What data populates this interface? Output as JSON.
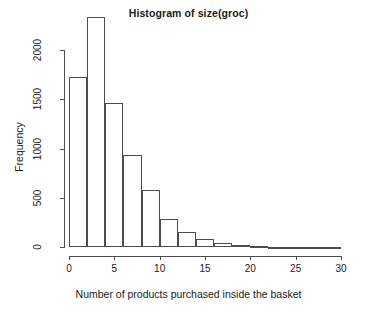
{
  "chart_data": {
    "type": "bar",
    "title": "Histogram of size(groc)",
    "xlabel": "Number of products purchased inside the basket",
    "ylabel": "Frequency",
    "grid": false,
    "legend": null,
    "xlim": [
      0,
      30
    ],
    "ylim": [
      0,
      2340
    ],
    "bin_width": 2,
    "xticks": [
      0,
      5,
      10,
      15,
      20,
      25,
      30
    ],
    "xtick_labels": [
      "0",
      "5",
      "10",
      "15",
      "20",
      "25",
      "30"
    ],
    "yticks": [
      0,
      500,
      1000,
      1500,
      2000
    ],
    "ytick_labels": [
      "0",
      "500",
      "1000",
      "1500",
      "2000"
    ],
    "bin_edges": [
      0,
      2,
      4,
      6,
      8,
      10,
      12,
      14,
      16,
      18,
      20,
      22,
      24,
      26,
      28,
      30
    ],
    "categories": [
      "0-2",
      "2-4",
      "4-6",
      "6-8",
      "8-10",
      "10-12",
      "12-14",
      "14-16",
      "16-18",
      "18-20",
      "20-22",
      "22-24",
      "24-26",
      "26-28",
      "28-30"
    ],
    "values": [
      1730,
      2340,
      1460,
      930,
      575,
      280,
      150,
      80,
      40,
      18,
      10,
      5,
      2,
      1,
      1
    ],
    "bar_edge_color": "#4d4d4d",
    "bar_fill_color": "transparent",
    "axis_color": "#4d4d4d",
    "text_color": "#1a1a1a",
    "background_color": "#ffffff"
  }
}
